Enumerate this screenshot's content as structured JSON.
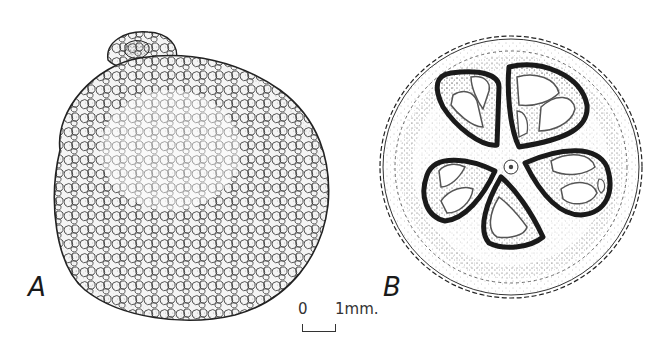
{
  "figure": {
    "panels": [
      {
        "id": "A",
        "label": "A",
        "view": "external view of fruit with tuberculate (warty) surface"
      },
      {
        "id": "B",
        "label": "B",
        "view": "transverse section showing five locules around a central axis"
      }
    ],
    "scale_bar": {
      "zero_label": "0",
      "unit_label": "1mm."
    },
    "colors": {
      "ink": "#1a1a1a",
      "stipple": "#555555",
      "background": "#ffffff"
    }
  }
}
